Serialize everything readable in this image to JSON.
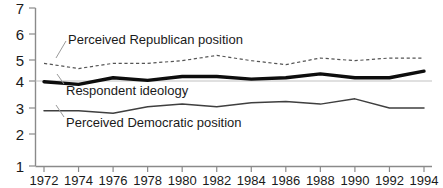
{
  "chart_data": {
    "type": "line",
    "title": "",
    "subtitle": "",
    "xlabel": "",
    "ylabel": "",
    "xlim": [
      1971,
      1995
    ],
    "ylim": [
      1,
      7
    ],
    "grid": false,
    "gridlines_shown": [
      "4"
    ],
    "legend_position": "inline-annotations",
    "x": [
      1972,
      1974,
      1976,
      1978,
      1980,
      1982,
      1984,
      1986,
      1988,
      1990,
      1992,
      1994
    ],
    "xticks": [
      "1972",
      "1974",
      "1976",
      "1978",
      "1980",
      "1982",
      "1984",
      "1986",
      "1988",
      "1990",
      "1992",
      "1994"
    ],
    "yticks": [
      "1",
      "2",
      "3",
      "4",
      "5",
      "6",
      "7"
    ],
    "series": [
      {
        "name": "Perceived Republican position",
        "style": "dashed",
        "color": "#555555",
        "width": 1.2,
        "values": [
          4.9,
          4.7,
          4.9,
          4.9,
          5.0,
          5.2,
          5.0,
          4.85,
          5.1,
          5.0,
          5.1,
          5.1
        ]
      },
      {
        "name": "Respondent ideology",
        "style": "solid-thick",
        "color": "#111111",
        "width": 3.2,
        "values": [
          4.2,
          4.1,
          4.35,
          4.25,
          4.4,
          4.4,
          4.3,
          4.35,
          4.5,
          4.35,
          4.35,
          4.6
        ]
      },
      {
        "name": "Perceived Democratic position",
        "style": "solid-thin",
        "color": "#444444",
        "width": 1.4,
        "values": [
          3.1,
          3.1,
          3.0,
          3.25,
          3.35,
          3.25,
          3.4,
          3.45,
          3.35,
          3.55,
          3.2,
          3.2
        ]
      }
    ],
    "annotations": [
      {
        "text": "Perceived Republican position",
        "x_px": 68,
        "y_px": 37,
        "leader_to_x": 57,
        "leader_to_y": 57
      },
      {
        "text": "Respondent ideology",
        "x_px": 66,
        "y_px": 88,
        "leader_to_x": 59,
        "leader_to_y": 79
      },
      {
        "text": "Perceived Democratic position",
        "x_px": 66,
        "y_px": 120,
        "leader_to_x": 57,
        "leader_to_y": 106
      }
    ]
  },
  "axes": {
    "y_axis_color": "#888888",
    "x_axis_color": "#888888",
    "gridline_color": "#bbbbbb",
    "tick_color": "#888888"
  }
}
